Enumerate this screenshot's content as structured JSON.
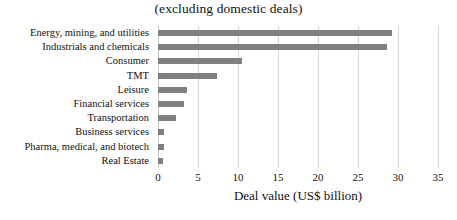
{
  "chart_data": {
    "type": "bar",
    "orientation": "horizontal",
    "title": "(excluding domestic deals)",
    "xlabel": "Deal value (US$ billion)",
    "ylabel": "",
    "xlim": [
      0,
      35
    ],
    "xticks": [
      0,
      5,
      10,
      15,
      20,
      25,
      30,
      35
    ],
    "grid": true,
    "legend": "none",
    "bar_color": "#808080",
    "categories": [
      "Energy, mining, and utilities",
      "Industrials and chemicals",
      "Consumer",
      "TMT",
      "Leisure",
      "Financial services",
      "Transportation",
      "Business services",
      "Pharma, medical, and biotech",
      "Real Estate"
    ],
    "values": [
      29.3,
      28.6,
      10.5,
      7.4,
      3.6,
      3.2,
      2.2,
      0.8,
      0.7,
      0.6
    ]
  }
}
